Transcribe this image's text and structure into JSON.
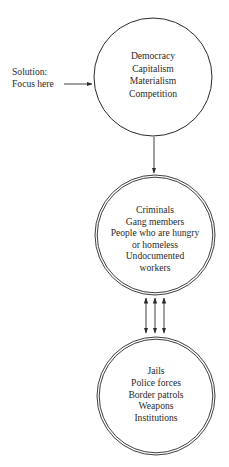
{
  "diagram": {
    "annotation": {
      "lines": [
        "Solution:",
        "Focus here"
      ]
    },
    "nodes": [
      {
        "id": "root-causes",
        "lines": [
          "Democracy",
          "Capitalism",
          "Materialism",
          "Competition"
        ],
        "ring": "single"
      },
      {
        "id": "affected-groups",
        "lines": [
          "Criminals",
          "Gang members",
          "People who are hungry",
          "or homeless",
          "Undocumented",
          "workers"
        ],
        "ring": "double"
      },
      {
        "id": "responses",
        "lines": [
          "Jails",
          "Police forces",
          "Border patrols",
          "Weapons",
          "Institutions"
        ],
        "ring": "double"
      }
    ],
    "edges": [
      {
        "from": "annotation",
        "to": "root-causes",
        "type": "arrow"
      },
      {
        "from": "root-causes",
        "to": "affected-groups",
        "type": "arrow"
      },
      {
        "from": "affected-groups",
        "to": "responses",
        "type": "double-arrow",
        "count": 3
      }
    ],
    "colors": {
      "stroke": "#2a2a2a",
      "background": "#ffffff"
    }
  }
}
